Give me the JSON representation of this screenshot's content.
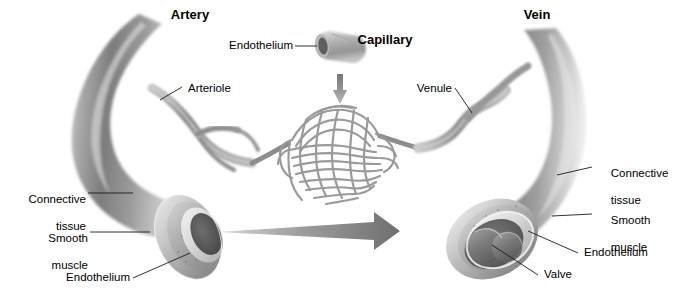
{
  "figure": {
    "background_color": "#ffffff",
    "width": 684,
    "height": 299
  },
  "headings": {
    "artery": "Artery",
    "capillary": "Capillary",
    "vein": "Vein"
  },
  "labels": {
    "capillary_endothelium": "Endothelium",
    "arteriole": "Arteriole",
    "venule": "Venule",
    "artery_connective_tissue_line1": "Connective",
    "artery_connective_tissue_line2": "tissue",
    "artery_smooth_muscle_line1": "Smooth",
    "artery_smooth_muscle_line2": "muscle",
    "artery_endothelium": "Endothelium",
    "vein_connective_tissue_line1": "Connective",
    "vein_connective_tissue_line2": "tissue",
    "vein_smooth_muscle_line1": "Smooth",
    "vein_smooth_muscle_line2": "muscle",
    "vein_endothelium": "Endothelium",
    "vein_valve": "Valve"
  },
  "colors": {
    "ink": "#000000",
    "leader_line": "#1a1a1a",
    "vessel_mid": "#8e8e8e",
    "vessel_light": "#d8d8d8",
    "vessel_dark": "#5a5a5a",
    "lumen_dark": "#4a4a4a",
    "capillary_outline": "#9a9a9a",
    "arrow_fill": "#9b9b9b"
  },
  "structure": {
    "vessel_types": [
      "artery",
      "capillary bed",
      "vein"
    ],
    "wall_layers": [
      "Connective tissue",
      "Smooth muscle",
      "Endothelium"
    ],
    "vein_feature": "Valve",
    "flow_direction": "left to right (artery to vein)"
  }
}
